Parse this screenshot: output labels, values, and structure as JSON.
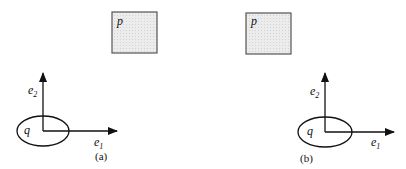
{
  "panels": [
    {
      "id": "a",
      "caption": "(a)",
      "box_label": "p",
      "ellipse_label": "q",
      "axis_x": {
        "base": "e",
        "sub": "1"
      },
      "axis_y": {
        "base": "e",
        "sub": "2"
      }
    },
    {
      "id": "b",
      "caption": "(b)",
      "box_label": "p",
      "ellipse_label": "q",
      "axis_x": {
        "base": "e",
        "sub": "1"
      },
      "axis_y": {
        "base": "e",
        "sub": "2"
      }
    }
  ],
  "colors": {
    "box_fill": "#e8e8e8",
    "stroke": "#111111"
  }
}
